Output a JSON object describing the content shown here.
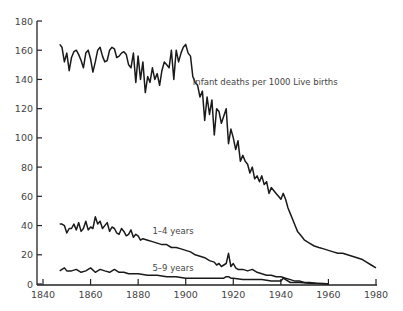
{
  "chart_data": {
    "type": "line",
    "title": "",
    "xlabel": "",
    "ylabel": "",
    "xlim": [
      1840,
      1980
    ],
    "ylim": [
      0,
      180
    ],
    "grid": false,
    "x_ticks": [
      1840,
      1860,
      1880,
      1900,
      1920,
      1940,
      1960,
      1980
    ],
    "y_ticks": [
      0,
      20,
      40,
      60,
      80,
      100,
      120,
      140,
      160,
      180
    ],
    "annotations": [
      {
        "text": "Infant deaths per 1000 Live births",
        "x": 1903,
        "y": 136
      },
      {
        "text": "1–4 years",
        "x": 1886,
        "y": 34
      },
      {
        "text": "5–9 years",
        "x": 1886,
        "y": 9
      }
    ],
    "series": [
      {
        "name": "Infant deaths per 1000 Live births",
        "x": [
          1847,
          1848,
          1849,
          1850,
          1851,
          1852,
          1853,
          1854,
          1855,
          1856,
          1857,
          1858,
          1859,
          1860,
          1861,
          1862,
          1863,
          1864,
          1865,
          1866,
          1867,
          1868,
          1869,
          1870,
          1871,
          1872,
          1873,
          1874,
          1875,
          1876,
          1877,
          1878,
          1879,
          1880,
          1881,
          1882,
          1883,
          1884,
          1885,
          1886,
          1887,
          1888,
          1889,
          1890,
          1891,
          1892,
          1893,
          1894,
          1895,
          1896,
          1897,
          1898,
          1899,
          1900,
          1901,
          1902,
          1903,
          1904,
          1905,
          1906,
          1907,
          1908,
          1909,
          1910,
          1911,
          1912,
          1913,
          1914,
          1915,
          1916,
          1917,
          1918,
          1919,
          1920,
          1921,
          1922,
          1923,
          1924,
          1925,
          1926,
          1927,
          1928,
          1929,
          1930,
          1931,
          1932,
          1933,
          1934,
          1935,
          1936,
          1937,
          1938,
          1939,
          1940,
          1941,
          1942,
          1943,
          1944,
          1945,
          1946,
          1947,
          1948,
          1949,
          1950,
          1952,
          1954,
          1956,
          1958,
          1960,
          1962,
          1964,
          1966,
          1968,
          1970,
          1972,
          1974,
          1976,
          1978,
          1980
        ],
        "values": [
          164,
          162,
          152,
          158,
          146,
          155,
          159,
          160,
          157,
          153,
          148,
          158,
          160,
          154,
          145,
          152,
          160,
          162,
          156,
          152,
          153,
          160,
          162,
          161,
          155,
          156,
          158,
          159,
          157,
          150,
          148,
          158,
          138,
          156,
          140,
          152,
          131,
          142,
          138,
          148,
          140,
          144,
          136,
          146,
          152,
          150,
          148,
          160,
          140,
          160,
          152,
          158,
          162,
          164,
          158,
          156,
          142,
          138,
          136,
          128,
          132,
          112,
          128,
          116,
          126,
          102,
          120,
          118,
          110,
          115,
          120,
          96,
          106,
          100,
          92,
          98,
          84,
          88,
          84,
          82,
          76,
          80,
          72,
          74,
          70,
          74,
          68,
          70,
          62,
          66,
          64,
          62,
          60,
          58,
          62,
          58,
          52,
          48,
          44,
          40,
          36,
          34,
          32,
          30,
          28,
          26,
          25,
          24,
          23,
          22,
          21,
          21,
          20,
          19,
          18,
          17,
          15,
          13,
          11
        ],
        "color": "#1a1a1a"
      },
      {
        "name": "1–4 years",
        "x": [
          1847,
          1848,
          1849,
          1850,
          1851,
          1852,
          1853,
          1854,
          1855,
          1856,
          1857,
          1858,
          1859,
          1860,
          1861,
          1862,
          1863,
          1864,
          1865,
          1866,
          1867,
          1868,
          1869,
          1870,
          1871,
          1872,
          1873,
          1874,
          1875,
          1876,
          1877,
          1878,
          1879,
          1880,
          1881,
          1882,
          1884,
          1886,
          1888,
          1890,
          1892,
          1894,
          1896,
          1898,
          1900,
          1902,
          1904,
          1906,
          1908,
          1910,
          1912,
          1913,
          1914,
          1915,
          1916,
          1917,
          1918,
          1919,
          1920,
          1921,
          1922,
          1924,
          1926,
          1928,
          1930,
          1932,
          1934,
          1936,
          1938,
          1940,
          1942,
          1944,
          1946,
          1948,
          1950,
          1952,
          1955,
          1958,
          1960
        ],
        "values": [
          41,
          41,
          40,
          35,
          38,
          38,
          41,
          37,
          42,
          36,
          38,
          43,
          37,
          39,
          38,
          46,
          41,
          43,
          38,
          40,
          42,
          36,
          39,
          38,
          35,
          34,
          38,
          36,
          33,
          34,
          37,
          32,
          34,
          33,
          30,
          31,
          30,
          29,
          28,
          27,
          27,
          25,
          25,
          24,
          23,
          22,
          20,
          19,
          18,
          16,
          15,
          13,
          14,
          12,
          13,
          14,
          21,
          12,
          14,
          11,
          10,
          10,
          9,
          10,
          8,
          7,
          6,
          6,
          5,
          5,
          4,
          3,
          2,
          2,
          1,
          1,
          0.5,
          0.3,
          0
        ],
        "color": "#1a1a1a"
      },
      {
        "name": "5–9 years",
        "x": [
          1847,
          1848,
          1849,
          1850,
          1852,
          1854,
          1856,
          1858,
          1860,
          1862,
          1864,
          1866,
          1868,
          1870,
          1872,
          1874,
          1876,
          1878,
          1880,
          1884,
          1888,
          1892,
          1896,
          1900,
          1904,
          1908,
          1912,
          1914,
          1916,
          1917,
          1918,
          1919,
          1920,
          1924,
          1928,
          1932,
          1936,
          1940,
          1941,
          1942,
          1944,
          1948,
          1952,
          1956,
          1960
        ],
        "values": [
          9,
          10,
          11,
          9,
          9,
          10,
          8,
          9,
          11,
          8,
          10,
          9,
          8,
          10,
          8,
          8,
          7,
          7,
          7,
          6,
          6,
          5,
          5,
          4,
          4,
          4,
          4,
          4,
          4,
          5,
          5,
          4,
          4,
          3,
          3,
          3,
          2,
          2,
          4,
          3,
          1,
          1,
          0.5,
          0.3,
          0
        ],
        "color": "#1a1a1a"
      }
    ]
  }
}
